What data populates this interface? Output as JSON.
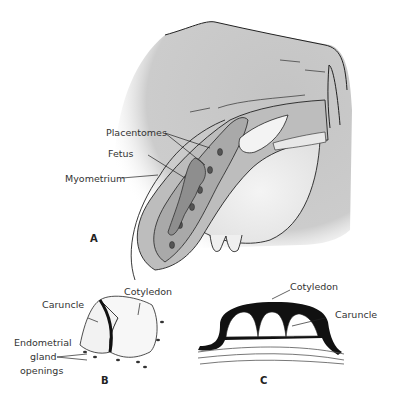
{
  "figure": {
    "panel_a": {
      "letter": "A",
      "labels": {
        "placentomes": "Placentomes",
        "fetus": "Fetus",
        "myometrium": "Myometrium"
      }
    },
    "panel_b": {
      "letter": "B",
      "labels": {
        "cotyledon": "Cotyledon",
        "caruncle": "Caruncle",
        "gland_line1": "Endometrial",
        "gland_line2": "gland",
        "gland_line3": "openings"
      }
    },
    "panel_c": {
      "letter": "C",
      "labels": {
        "cotyledon": "Cotyledon",
        "caruncle": "Caruncle"
      }
    },
    "colors": {
      "body_shade": "#c8c8c8",
      "uterus_fill": "#b5b5b5",
      "line": "#222222",
      "cotyledon_dark": "#111111"
    }
  }
}
